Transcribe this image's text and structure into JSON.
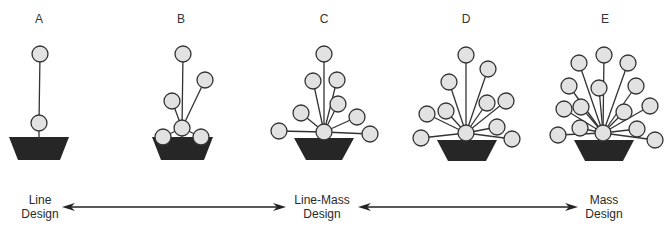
{
  "figure": {
    "panels": [
      {
        "letter": "A",
        "cx": 39,
        "vase": [
          9,
          137,
          69,
          137,
          60,
          160,
          18,
          160
        ],
        "center": [
          39,
          123
        ],
        "flowers": [
          [
            40,
            54
          ]
        ]
      },
      {
        "letter": "B",
        "cx": 182,
        "vase": [
          152,
          137,
          213,
          137,
          204,
          160,
          161,
          160
        ],
        "center": [
          182,
          128
        ],
        "flowers": [
          [
            183,
            54
          ],
          [
            205,
            80
          ],
          [
            172,
            101
          ],
          [
            163,
            137
          ],
          [
            201,
            137
          ]
        ]
      },
      {
        "letter": "C",
        "cx": 324,
        "vase": [
          294,
          138,
          354,
          138,
          342,
          160,
          306,
          160
        ],
        "center": [
          324,
          132
        ],
        "flowers": [
          [
            324,
            54
          ],
          [
            313,
            81
          ],
          [
            337,
            80
          ],
          [
            338,
            104
          ],
          [
            301,
            113
          ],
          [
            357,
            117
          ],
          [
            279,
            131
          ],
          [
            370,
            134
          ]
        ]
      },
      {
        "letter": "D",
        "cx": 466,
        "vase": [
          437,
          140,
          497,
          140,
          486,
          161,
          448,
          161
        ],
        "center": [
          466,
          133
        ],
        "flowers": [
          [
            466,
            55
          ],
          [
            488,
            69
          ],
          [
            449,
            82
          ],
          [
            487,
            103
          ],
          [
            506,
            101
          ],
          [
            427,
            114
          ],
          [
            446,
            111
          ],
          [
            497,
            127
          ],
          [
            421,
            138
          ],
          [
            512,
            139
          ]
        ]
      },
      {
        "letter": "E",
        "cx": 604,
        "vase": [
          574,
          140,
          634,
          140,
          623,
          161,
          585,
          161
        ],
        "center": [
          603,
          133
        ],
        "flowers": [
          [
            604,
            55
          ],
          [
            579,
            63
          ],
          [
            628,
            63
          ],
          [
            569,
            86
          ],
          [
            599,
            88
          ],
          [
            636,
            86
          ],
          [
            564,
            109
          ],
          [
            581,
            107
          ],
          [
            624,
            112
          ],
          [
            650,
            106
          ],
          [
            580,
            128
          ],
          [
            637,
            129
          ],
          [
            558,
            135
          ],
          [
            655,
            140
          ]
        ]
      }
    ],
    "scale": {
      "labels": [
        {
          "line1": "Line",
          "line2": "Design",
          "x": 40
        },
        {
          "line1": "Line-Mass",
          "line2": "Design",
          "x": 322
        },
        {
          "line1": "Mass",
          "line2": "Design",
          "x": 604
        }
      ],
      "arrows": [
        {
          "x1": 62,
          "x2": 286,
          "y": 207
        },
        {
          "x1": 358,
          "x2": 578,
          "y": 207
        }
      ]
    },
    "colors": {
      "vase": "#262626",
      "flower_fill": "#e2e2e2",
      "stroke": "#333333"
    }
  }
}
